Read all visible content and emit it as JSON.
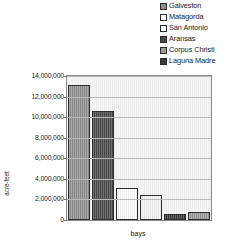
{
  "chart_data": {
    "type": "bar",
    "title": "",
    "xlabel": "bays",
    "ylabel": "acre-feet",
    "categories": [
      "Galveston",
      "Matagorda",
      "San Antonio",
      "Aransas",
      "Corpus Christi",
      "Laguna Madre"
    ],
    "values": [
      13100000,
      10600000,
      3100000,
      2450000,
      550000,
      750000
    ],
    "ylim": [
      0,
      14000000
    ],
    "ytick_values": [
      0,
      2000000,
      4000000,
      6000000,
      8000000,
      10000000,
      12000000,
      14000000
    ],
    "ytick_labels": [
      "0",
      "2,000,000",
      "4,000,000",
      "6,000,000",
      "8,000,000",
      "10,000,000",
      "12,000,000",
      "14,000,000"
    ],
    "grid": true,
    "legend_position": "top-right",
    "series": [
      {
        "name": "Galveston",
        "value": 13100000,
        "color": "#8f8f8f"
      },
      {
        "name": "Matagorda",
        "value": 10600000,
        "color": "#4a4a4a"
      },
      {
        "name": "San Antonio",
        "value": 3100000,
        "color": "#fdfdfd"
      },
      {
        "name": "Aransas",
        "value": 2450000,
        "color": "#f4f4f4"
      },
      {
        "name": "Corpus Christi",
        "value": 550000,
        "color": "#3a3a3a"
      },
      {
        "name": "Laguna Madre",
        "value": 750000,
        "color": "#9a9a9a"
      }
    ]
  },
  "legend": {
    "items": [
      {
        "label": "Galveston",
        "swatch": "#8f8f8f"
      },
      {
        "label": "Matagorda",
        "swatch": "#ffffff"
      },
      {
        "label": "San Antonio",
        "swatch": "#fbfbfb"
      },
      {
        "label": "Aransas",
        "swatch": "#4a4a4a"
      },
      {
        "label": "Corpus Christi",
        "swatch": "#9a9a9a"
      },
      {
        "label": "Laguna Madre",
        "swatch": "#3a3a3a"
      }
    ]
  },
  "axes": {
    "y_title": "acre-feet",
    "x_title": "bays"
  },
  "colors": {
    "plot_background": "#ececeb",
    "gridline": "#b9b9b9",
    "axis_line": "#8a8a8a",
    "bar_outline": "#2e2e2e",
    "text": "#1a1a1a"
  }
}
